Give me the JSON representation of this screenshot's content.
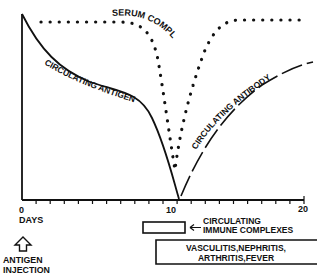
{
  "diagram": {
    "title": "",
    "curves": [
      {
        "id": "serum-complement",
        "label": "SERUM COMPLEMENT",
        "style": "dotted"
      },
      {
        "id": "circulating-antigen",
        "label": "CIRCULATING ANTIGEN",
        "style": "solid"
      },
      {
        "id": "circulating-antibody",
        "label": "CIRCULATING ANTIBODY",
        "style": "dashed"
      }
    ],
    "x_axis": {
      "label": "DAYS",
      "ticks": [
        "0",
        "10",
        "20"
      ],
      "range": [
        0,
        20
      ]
    },
    "annotations": {
      "antigen_injection_line1": "ANTIGEN",
      "antigen_injection_line2": "INJECTION",
      "immune_complexes_line1": "CIRCULATING",
      "immune_complexes_line2": "IMMUNE COMPLEXES",
      "symptoms_line1": "VASCULITIS,NEPHRITIS,",
      "symptoms_line2": "ARTHRITIS,FEVER"
    },
    "colors": {
      "ink": "#111111",
      "background": "#ffffff"
    }
  }
}
